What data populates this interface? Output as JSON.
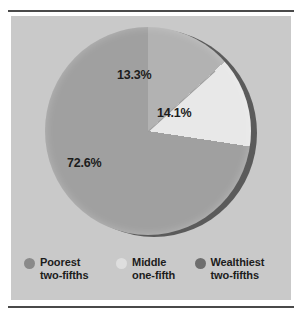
{
  "chart_data": {
    "type": "pie",
    "title": "",
    "subtitle": "",
    "xlabel": "",
    "ylabel": "",
    "legend_position": "bottom",
    "grid": false,
    "categories": [
      "Poorest two-fifths",
      "Middle one-fifth",
      "Wealthiest two-fifths"
    ],
    "values": [
      72.6,
      13.3,
      14.1
    ],
    "slices": [
      {
        "label": "Poorest two-fifths",
        "label_line1": "Poorest",
        "label_line2": "two-fifths",
        "value": 72.6,
        "display": "72.6%",
        "color": "#a0a0a0",
        "swatch_color": "#8a8a8a"
      },
      {
        "label": "Middle one-fifth",
        "label_line1": "Middle",
        "label_line2": "one-fifth",
        "value": 13.3,
        "display": "13.3%",
        "color": "#b2b2b2",
        "swatch_color": "#dedede"
      },
      {
        "label": "Wealthiest two-fifths",
        "label_line1": "Wealthiest",
        "label_line2": "two-fifths",
        "value": 14.1,
        "display": "14.1%",
        "color": "#e8e8e8",
        "swatch_color": "#6e6e6e"
      }
    ],
    "data_labels": [
      "13.3%",
      "14.1%",
      "72.6%"
    ]
  },
  "style": {
    "panel_background": "#c9c9c9",
    "page_background": "#ffffff",
    "rule_color": "#4a4a4a",
    "text_color": "#1c1c1c",
    "shadow_color": "#5b5b5b"
  }
}
